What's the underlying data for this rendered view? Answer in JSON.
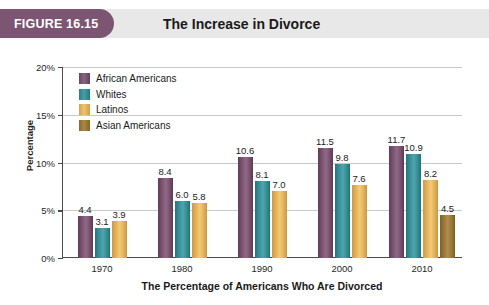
{
  "header": {
    "badge_label": "FIGURE 16.15",
    "title": "The Increase in Divorce",
    "badge_color": "#7b5572",
    "band_color": "#e8e8e8"
  },
  "chart_data": {
    "type": "bar",
    "title": "The Increase in Divorce",
    "xlabel": "The Percentage of Americans Who Are Divorced",
    "ylabel": "Percentage",
    "ylim": [
      0,
      20
    ],
    "yticks": [
      0,
      5,
      10,
      15,
      20
    ],
    "ytick_labels": [
      "0%",
      "5%",
      "10%",
      "15%",
      "20%"
    ],
    "grid": true,
    "grid_axis": "y",
    "legend_position": "upper-left-inside",
    "categories": [
      "1970",
      "1980",
      "1990",
      "2000",
      "2010"
    ],
    "series": [
      {
        "name": "African Americans",
        "color": "#7b5572",
        "values": [
          4.4,
          8.4,
          10.6,
          11.5,
          11.7
        ],
        "labels": [
          "4.4",
          "8.4",
          "10.6",
          "11.5",
          "11.7"
        ]
      },
      {
        "name": "Whites",
        "color": "#3a9199",
        "values": [
          3.1,
          6.0,
          8.1,
          9.8,
          10.9
        ],
        "labels": [
          "3.1",
          "6.0",
          "8.1",
          "9.8",
          "10.9"
        ]
      },
      {
        "name": "Latinos",
        "color": "#e3b55f",
        "values": [
          3.9,
          5.8,
          7.0,
          7.6,
          8.2
        ],
        "labels": [
          "3.9",
          "5.8",
          "7.0",
          "7.6",
          "8.2"
        ]
      },
      {
        "name": "Asian Americans",
        "color": "#9b7a3c",
        "values": [
          null,
          null,
          null,
          null,
          4.5
        ],
        "labels": [
          "",
          "",
          "",
          "",
          "4.5"
        ]
      }
    ]
  },
  "legend": {
    "items": [
      {
        "label": "African Americans",
        "color": "#7b5572"
      },
      {
        "label": "Whites",
        "color": "#3a9199"
      },
      {
        "label": "Latinos",
        "color": "#e3b55f"
      },
      {
        "label": "Asian Americans",
        "color": "#9b7a3c"
      }
    ]
  },
  "axes": {
    "y_title": "Percentage",
    "x_title": "The Percentage of Americans Who Are Divorced",
    "y_labels": [
      "20%",
      "15%",
      "10%",
      "5%",
      "0%"
    ],
    "x_labels": [
      "1970",
      "1980",
      "1990",
      "2000",
      "2010"
    ]
  }
}
